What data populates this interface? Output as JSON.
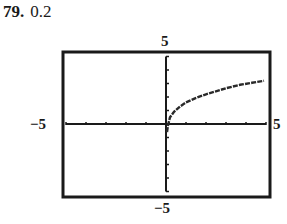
{
  "problem": {
    "number": "79.",
    "answer": "0.2"
  },
  "labels": {
    "ymax": "5",
    "ymin": "−5",
    "xmin": "−5",
    "xmax": "5"
  },
  "chart_data": {
    "type": "line",
    "title": "",
    "xlabel": "",
    "ylabel": "",
    "xlim": [
      -5,
      5
    ],
    "ylim": [
      -5,
      5
    ],
    "xticks_step": 1,
    "yticks_step": 1,
    "grid": false,
    "series": [
      {
        "name": "f(x)",
        "x": [
          0.05,
          0.1,
          0.2,
          0.4,
          0.7,
          1.0,
          1.45,
          2.0,
          2.45,
          3.0,
          3.7,
          4.3,
          4.9
        ],
        "y": [
          -0.6,
          -0.1,
          0.5,
          0.9,
          1.3,
          1.6,
          1.9,
          2.2,
          2.4,
          2.65,
          2.9,
          3.05,
          3.2
        ]
      }
    ]
  }
}
